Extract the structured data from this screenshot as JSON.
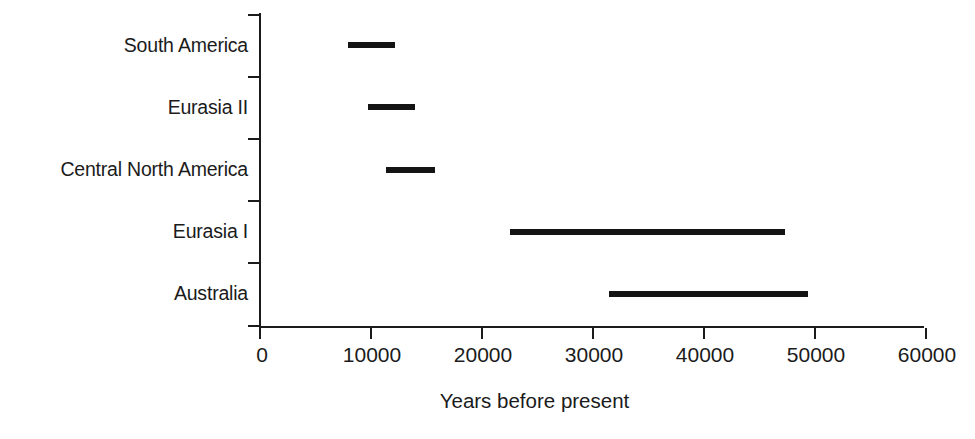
{
  "chart_data": {
    "type": "bar",
    "orientation": "horizontal",
    "subtype": "range-bar",
    "title": "",
    "xlabel": "Years before present",
    "ylabel": "",
    "categories": [
      "South America",
      "Eurasia II",
      "Central North America",
      "Eurasia I",
      "Australia"
    ],
    "ranges": [
      {
        "category": "South America",
        "start": 8000,
        "end": 12250
      },
      {
        "category": "Eurasia II",
        "start": 9800,
        "end": 14100
      },
      {
        "category": "Central North America",
        "start": 11400,
        "end": 15900
      },
      {
        "category": "Eurasia I",
        "start": 22600,
        "end": 47400
      },
      {
        "category": "Australia",
        "start": 31500,
        "end": 49500
      }
    ],
    "xlim": [
      0,
      60000
    ],
    "xticks": [
      0,
      10000,
      20000,
      30000,
      40000,
      50000,
      60000
    ],
    "xtick_labels": [
      "0",
      "10000",
      "20000",
      "30000",
      "40000",
      "50000",
      "60000"
    ],
    "grid": false,
    "legend": false,
    "bar_color": "#141414",
    "axis_color": "#1b1b1b",
    "background_color": "#ffffff"
  }
}
